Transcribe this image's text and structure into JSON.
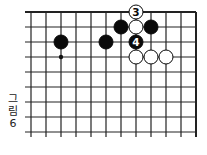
{
  "figure": {
    "caption_line1": "그",
    "caption_line2": "림",
    "caption_line3": "6"
  },
  "board": {
    "origin_x": 31,
    "origin_y": 12,
    "spacing": 15,
    "cols": 12,
    "rows": 9,
    "top_edge": true,
    "right_edge": true,
    "line_color": "#222222",
    "hoshi": [
      {
        "col": 2,
        "row": 3
      }
    ],
    "stones": [
      {
        "col": 2,
        "row": 2,
        "color": "black",
        "label": ""
      },
      {
        "col": 5,
        "row": 2,
        "color": "black",
        "label": ""
      },
      {
        "col": 6,
        "row": 1,
        "color": "black",
        "label": ""
      },
      {
        "col": 7,
        "row": 1,
        "color": "white",
        "label": ""
      },
      {
        "col": 8,
        "row": 1,
        "color": "black",
        "label": ""
      },
      {
        "col": 7,
        "row": 0,
        "color": "white",
        "label": "3"
      },
      {
        "col": 7,
        "row": 2,
        "color": "black",
        "label": "4"
      },
      {
        "col": 7,
        "row": 3,
        "color": "white",
        "label": ""
      },
      {
        "col": 8,
        "row": 3,
        "color": "white",
        "label": ""
      },
      {
        "col": 9,
        "row": 3,
        "color": "white",
        "label": ""
      }
    ]
  }
}
